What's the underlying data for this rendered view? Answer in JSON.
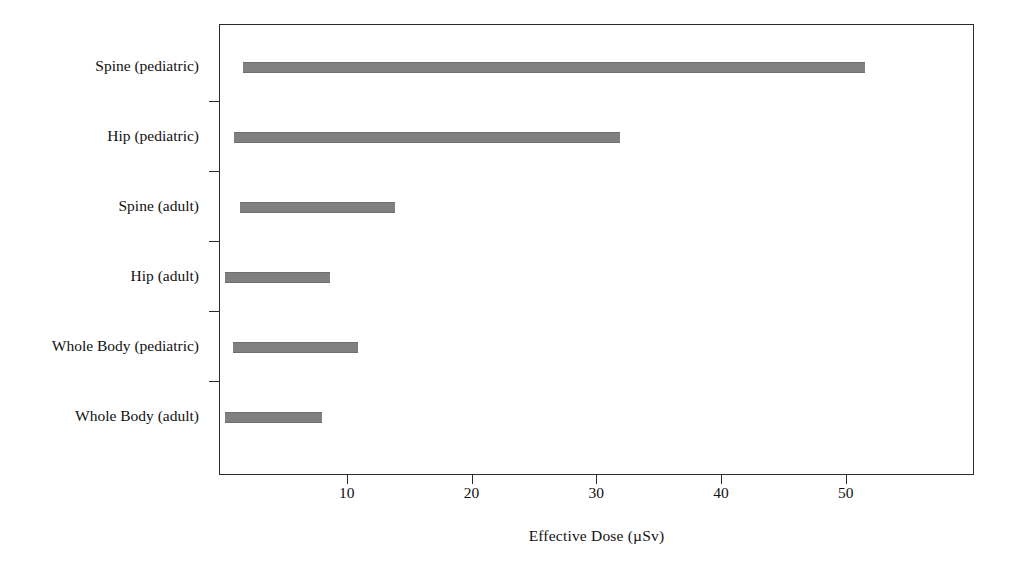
{
  "chart_data": {
    "type": "bar",
    "orientation": "horizontal",
    "title": "",
    "subtitle": "",
    "xlabel": "Effective  Dose (µSv)",
    "ylabel": "",
    "xlim": [
      0,
      60.2
    ],
    "grid": false,
    "legend": null,
    "bar_style": "range-bar",
    "bar_color": "#808080",
    "frame_color": "#2b2b2b",
    "xticks": [
      10,
      20,
      30,
      40,
      50
    ],
    "xtick_labels": [
      "10",
      "20",
      "30",
      "40",
      "50"
    ],
    "categories": [
      "Spine (pediatric)",
      "Hip (pediatric)",
      "Spine (adult)",
      "Hip (adult)",
      "Whole Body (pediatric)",
      "Whole Body (adult)"
    ],
    "series": [
      {
        "name": "Effective Dose range",
        "starts": [
          1.6,
          0.9,
          1.4,
          0.2,
          0.8,
          0.2
        ],
        "ends": [
          51.5,
          31.8,
          13.8,
          8.6,
          10.8,
          7.9
        ]
      }
    ],
    "bars": [
      {
        "category": "Spine (pediatric)",
        "start": 1.6,
        "end": 51.5
      },
      {
        "category": "Hip (pediatric)",
        "start": 0.9,
        "end": 31.8
      },
      {
        "category": "Spine (adult)",
        "start": 1.4,
        "end": 13.8
      },
      {
        "category": "Hip (adult)",
        "start": 0.2,
        "end": 8.6
      },
      {
        "category": "Whole Body (pediatric)",
        "start": 0.8,
        "end": 10.8
      },
      {
        "category": "Whole Body (adult)",
        "start": 0.2,
        "end": 7.9
      }
    ]
  }
}
